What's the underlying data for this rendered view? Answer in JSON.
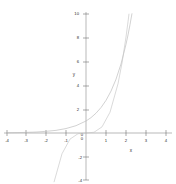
{
  "chart_data": {
    "type": "line",
    "title": "",
    "xlabel": "x",
    "ylabel": "y",
    "xlim": [
      -4,
      4
    ],
    "ylim": [
      -4,
      10
    ],
    "grid": false,
    "legend": "none",
    "x_ticks": [
      "-4",
      "-3",
      "-2",
      "-1",
      "0",
      "1",
      "2",
      "3",
      "4"
    ],
    "x_tick_values": [
      -4,
      -3,
      -2,
      -1,
      0,
      1,
      2,
      3,
      4
    ],
    "y_ticks": [
      "10",
      "8",
      "6",
      "4",
      "2",
      "0",
      "-2",
      "-4"
    ],
    "y_tick_values": [
      10,
      8,
      6,
      4,
      2,
      0,
      -2,
      -4
    ],
    "series": [
      {
        "name": "exponential",
        "color": "#b9b9b9",
        "x": [
          -4,
          -3.5,
          -3,
          -2.5,
          -2,
          -1.5,
          -1,
          -0.5,
          0,
          0.25,
          0.5,
          0.75,
          1,
          1.25,
          1.5,
          1.75,
          2,
          2.1,
          2.2,
          2.3
        ],
        "values": [
          0.02,
          0.03,
          0.05,
          0.08,
          0.14,
          0.22,
          0.37,
          0.61,
          1,
          1.28,
          1.65,
          2.12,
          2.72,
          3.49,
          4.48,
          5.75,
          7.39,
          8.17,
          9.03,
          9.97
        ]
      },
      {
        "name": "cubic",
        "color": "#c6c6c6",
        "x": [
          -4,
          -3.6,
          -3.2,
          -2.8,
          -2.4,
          -2,
          -1.6,
          -1.2,
          -0.8,
          -0.4,
          0,
          0.4,
          0.8,
          1.2,
          1.6,
          1.8,
          2,
          2.1,
          2.15
        ],
        "values": [
          -56,
          -40.7,
          -28.8,
          -19.9,
          -13.0,
          -8,
          -4.1,
          -1.73,
          -0.51,
          -0.06,
          0,
          0.06,
          0.51,
          1.73,
          4.1,
          5.83,
          8,
          9.26,
          9.94
        ]
      }
    ],
    "axis_color": "#8a8a8a"
  }
}
